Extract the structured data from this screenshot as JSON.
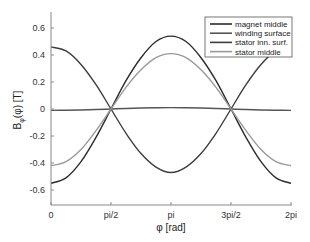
{
  "chart_data": {
    "type": "line",
    "title": "",
    "xlabel": "φ [rad]",
    "ylabel_main": "B",
    "ylabel_sub": "φ",
    "ylabel_rest": "(φ)  [T]",
    "xlim": [
      0,
      6.2832
    ],
    "ylim": [
      -0.7,
      0.7
    ],
    "grid": false,
    "legend_position": "upper right",
    "xticks": [
      {
        "value": 0,
        "label": "0"
      },
      {
        "value": 1.5708,
        "label": "pi/2"
      },
      {
        "value": 3.1416,
        "label": "pi"
      },
      {
        "value": 4.7124,
        "label": "3pi/2"
      },
      {
        "value": 6.2832,
        "label": "2pi"
      }
    ],
    "yticks": [
      {
        "value": 0.6,
        "label": "0.6"
      },
      {
        "value": 0.4,
        "label": "0.4"
      },
      {
        "value": 0.2,
        "label": "0.2"
      },
      {
        "value": 0,
        "label": "0"
      },
      {
        "value": -0.2,
        "label": "-0.2"
      },
      {
        "value": -0.4,
        "label": "-0.4"
      },
      {
        "value": -0.6,
        "label": "-0.6"
      }
    ],
    "x": [
      0,
      0.3927,
      0.7854,
      1.1781,
      1.5708,
      1.9635,
      2.3562,
      2.7489,
      3.1416,
      3.5343,
      3.927,
      4.3197,
      4.7124,
      5.1051,
      5.4978,
      5.8905,
      6.2832
    ],
    "series": [
      {
        "name": "magnet middle",
        "color": "#2b2b2b",
        "values": [
          -0.55,
          -0.51,
          -0.39,
          -0.21,
          0.0,
          0.21,
          0.38,
          0.5,
          0.54,
          0.5,
          0.38,
          0.21,
          0.0,
          -0.21,
          -0.39,
          -0.51,
          -0.55
        ]
      },
      {
        "name": "winding surface",
        "color": "#555555",
        "values": [
          -0.01,
          -0.009,
          -0.007,
          -0.004,
          0.0,
          0.004,
          0.007,
          0.009,
          0.01,
          0.009,
          0.007,
          0.004,
          0.0,
          -0.004,
          -0.007,
          -0.009,
          -0.01
        ]
      },
      {
        "name": "stator inn. surf.",
        "color": "#3d3d3d",
        "values": [
          0.46,
          0.43,
          0.33,
          0.18,
          0.0,
          -0.18,
          -0.33,
          -0.43,
          -0.47,
          -0.43,
          -0.33,
          -0.18,
          0.0,
          0.18,
          0.33,
          0.43,
          0.46
        ]
      },
      {
        "name": "stator middle",
        "color": "#9a9a9a",
        "values": [
          -0.42,
          -0.39,
          -0.3,
          -0.16,
          0.0,
          0.16,
          0.29,
          0.38,
          0.41,
          0.38,
          0.29,
          0.16,
          0.0,
          -0.16,
          -0.3,
          -0.39,
          -0.42
        ]
      }
    ]
  }
}
